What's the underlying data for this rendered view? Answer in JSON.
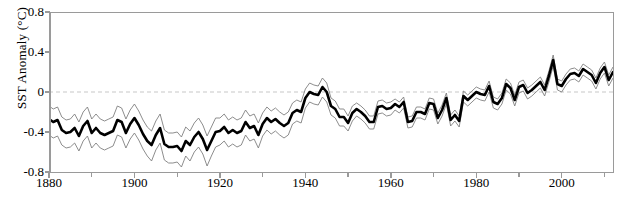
{
  "axes": {
    "ylabel": "SST Anomaly (°C)",
    "xlabel": "",
    "yticks": [
      "0.8",
      "0.4",
      "0",
      "-0.4",
      "-0.8"
    ],
    "ytick_values": [
      0.8,
      0.4,
      0,
      -0.4,
      -0.8
    ],
    "xticks": [
      "1880",
      "1900",
      "1920",
      "1940",
      "1960",
      "1980",
      "2000"
    ],
    "xtick_values": [
      1880,
      1900,
      1920,
      1940,
      1960,
      1980,
      2000
    ],
    "xminor_step": 10,
    "ylim": [
      -0.8,
      0.8
    ],
    "xlim": [
      1880,
      2012
    ]
  },
  "colors": {
    "line": "#000000",
    "band": "#808080",
    "zero_line": "#c8c8c8",
    "spine": "#9a9a9a",
    "background": "#ffffff"
  },
  "chart_data": {
    "type": "line",
    "title": "",
    "xlabel": "",
    "ylabel": "SST Anomaly (°C)",
    "xlim": [
      1880,
      2012
    ],
    "ylim": [
      -0.8,
      0.8
    ],
    "grid": false,
    "legend": "none",
    "annotations": [
      "zero reference line (dashed, light gray) at y = 0"
    ],
    "x": [
      1880,
      1881,
      1882,
      1883,
      1884,
      1885,
      1886,
      1887,
      1888,
      1889,
      1890,
      1891,
      1892,
      1893,
      1894,
      1895,
      1896,
      1897,
      1898,
      1899,
      1900,
      1901,
      1902,
      1903,
      1904,
      1905,
      1906,
      1907,
      1908,
      1909,
      1910,
      1911,
      1912,
      1913,
      1914,
      1915,
      1916,
      1917,
      1918,
      1919,
      1920,
      1921,
      1922,
      1923,
      1924,
      1925,
      1926,
      1927,
      1928,
      1929,
      1930,
      1931,
      1932,
      1933,
      1934,
      1935,
      1936,
      1937,
      1938,
      1939,
      1940,
      1941,
      1942,
      1943,
      1944,
      1945,
      1946,
      1947,
      1948,
      1949,
      1950,
      1951,
      1952,
      1953,
      1954,
      1955,
      1956,
      1957,
      1958,
      1959,
      1960,
      1961,
      1962,
      1963,
      1964,
      1965,
      1966,
      1967,
      1968,
      1969,
      1970,
      1971,
      1972,
      1973,
      1974,
      1975,
      1976,
      1977,
      1978,
      1979,
      1980,
      1981,
      1982,
      1983,
      1984,
      1985,
      1986,
      1987,
      1988,
      1989,
      1990,
      1991,
      1992,
      1993,
      1994,
      1995,
      1996,
      1997,
      1998,
      1999,
      2000,
      2001,
      2002,
      2003,
      2004,
      2005,
      2006,
      2007,
      2008,
      2009,
      2010,
      2011,
      2012
    ],
    "series": [
      {
        "name": "SST anomaly",
        "style": "thick black line",
        "values": [
          -0.27,
          -0.3,
          -0.28,
          -0.38,
          -0.41,
          -0.4,
          -0.36,
          -0.44,
          -0.34,
          -0.29,
          -0.41,
          -0.36,
          -0.41,
          -0.43,
          -0.41,
          -0.39,
          -0.28,
          -0.3,
          -0.41,
          -0.32,
          -0.26,
          -0.33,
          -0.42,
          -0.49,
          -0.53,
          -0.43,
          -0.36,
          -0.52,
          -0.55,
          -0.55,
          -0.54,
          -0.59,
          -0.49,
          -0.53,
          -0.45,
          -0.4,
          -0.47,
          -0.58,
          -0.49,
          -0.4,
          -0.39,
          -0.35,
          -0.41,
          -0.38,
          -0.41,
          -0.39,
          -0.3,
          -0.36,
          -0.34,
          -0.43,
          -0.32,
          -0.26,
          -0.3,
          -0.27,
          -0.31,
          -0.34,
          -0.31,
          -0.21,
          -0.18,
          -0.2,
          -0.06,
          0.0,
          -0.02,
          -0.03,
          0.05,
          0.0,
          -0.14,
          -0.17,
          -0.25,
          -0.25,
          -0.31,
          -0.21,
          -0.17,
          -0.2,
          -0.24,
          -0.3,
          -0.3,
          -0.15,
          -0.14,
          -0.17,
          -0.16,
          -0.12,
          -0.15,
          -0.1,
          -0.3,
          -0.29,
          -0.2,
          -0.2,
          -0.22,
          -0.11,
          -0.12,
          -0.26,
          -0.18,
          -0.06,
          -0.28,
          -0.23,
          -0.29,
          -0.04,
          -0.08,
          -0.04,
          0.0,
          -0.02,
          -0.03,
          0.06,
          -0.1,
          -0.12,
          -0.06,
          0.08,
          0.04,
          -0.08,
          0.05,
          0.07,
          -0.01,
          0.02,
          0.06,
          0.1,
          0.02,
          0.16,
          0.32,
          0.08,
          0.06,
          0.13,
          0.18,
          0.19,
          0.16,
          0.23,
          0.2,
          0.17,
          0.09,
          0.19,
          0.25,
          0.12,
          0.2
        ]
      },
      {
        "name": "upper uncertainty bound",
        "style": "thin gray line",
        "values": [
          -0.14,
          -0.17,
          -0.15,
          -0.25,
          -0.28,
          -0.27,
          -0.22,
          -0.3,
          -0.2,
          -0.15,
          -0.27,
          -0.22,
          -0.27,
          -0.29,
          -0.27,
          -0.25,
          -0.14,
          -0.16,
          -0.27,
          -0.18,
          -0.12,
          -0.19,
          -0.28,
          -0.35,
          -0.39,
          -0.29,
          -0.22,
          -0.38,
          -0.41,
          -0.41,
          -0.4,
          -0.45,
          -0.35,
          -0.39,
          -0.31,
          -0.26,
          -0.33,
          -0.44,
          -0.35,
          -0.26,
          -0.26,
          -0.22,
          -0.28,
          -0.25,
          -0.28,
          -0.26,
          -0.18,
          -0.24,
          -0.22,
          -0.31,
          -0.21,
          -0.15,
          -0.19,
          -0.16,
          -0.2,
          -0.23,
          -0.2,
          -0.11,
          -0.08,
          -0.1,
          0.03,
          0.09,
          0.07,
          0.06,
          0.14,
          0.09,
          -0.06,
          -0.09,
          -0.17,
          -0.17,
          -0.24,
          -0.14,
          -0.11,
          -0.14,
          -0.18,
          -0.24,
          -0.24,
          -0.09,
          -0.08,
          -0.11,
          -0.1,
          -0.07,
          -0.1,
          -0.05,
          -0.25,
          -0.24,
          -0.15,
          -0.15,
          -0.17,
          -0.06,
          -0.07,
          -0.21,
          -0.13,
          -0.01,
          -0.23,
          -0.18,
          -0.24,
          0.01,
          -0.03,
          0.01,
          0.05,
          0.03,
          0.02,
          0.11,
          -0.05,
          -0.07,
          -0.01,
          0.13,
          0.09,
          -0.03,
          0.1,
          0.12,
          0.04,
          0.07,
          0.11,
          0.15,
          0.07,
          0.21,
          0.37,
          0.13,
          0.11,
          0.18,
          0.23,
          0.24,
          0.21,
          0.28,
          0.25,
          0.22,
          0.14,
          0.24,
          0.3,
          0.17,
          0.25
        ]
      },
      {
        "name": "lower uncertainty bound",
        "style": "thin gray line",
        "values": [
          -0.43,
          -0.46,
          -0.44,
          -0.53,
          -0.56,
          -0.55,
          -0.51,
          -0.59,
          -0.49,
          -0.44,
          -0.56,
          -0.51,
          -0.56,
          -0.58,
          -0.56,
          -0.54,
          -0.43,
          -0.45,
          -0.56,
          -0.47,
          -0.41,
          -0.48,
          -0.57,
          -0.64,
          -0.69,
          -0.58,
          -0.51,
          -0.68,
          -0.71,
          -0.71,
          -0.7,
          -0.75,
          -0.64,
          -0.69,
          -0.6,
          -0.55,
          -0.62,
          -0.74,
          -0.64,
          -0.55,
          -0.53,
          -0.49,
          -0.55,
          -0.52,
          -0.55,
          -0.53,
          -0.43,
          -0.49,
          -0.47,
          -0.56,
          -0.44,
          -0.38,
          -0.42,
          -0.39,
          -0.43,
          -0.46,
          -0.43,
          -0.32,
          -0.29,
          -0.31,
          -0.16,
          -0.1,
          -0.12,
          -0.13,
          -0.05,
          -0.1,
          -0.23,
          -0.26,
          -0.34,
          -0.34,
          -0.39,
          -0.29,
          -0.24,
          -0.27,
          -0.31,
          -0.37,
          -0.37,
          -0.22,
          -0.21,
          -0.24,
          -0.23,
          -0.18,
          -0.21,
          -0.16,
          -0.36,
          -0.35,
          -0.26,
          -0.26,
          -0.28,
          -0.17,
          -0.18,
          -0.32,
          -0.24,
          -0.12,
          -0.34,
          -0.29,
          -0.35,
          -0.1,
          -0.14,
          -0.1,
          -0.06,
          -0.08,
          -0.09,
          0.0,
          -0.16,
          -0.18,
          -0.12,
          0.02,
          -0.02,
          -0.14,
          -0.01,
          0.01,
          -0.07,
          -0.04,
          0.0,
          0.04,
          -0.04,
          0.1,
          0.26,
          0.02,
          0.0,
          0.07,
          0.12,
          0.13,
          0.1,
          0.17,
          0.14,
          0.11,
          0.03,
          0.13,
          0.19,
          0.06,
          0.14
        ]
      }
    ]
  }
}
